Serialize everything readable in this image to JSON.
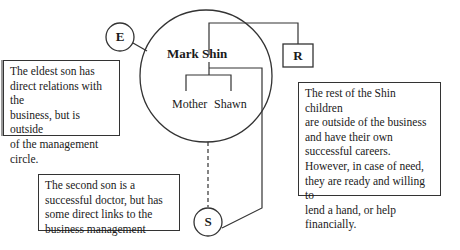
{
  "diagram": {
    "center_person": "Mark Shin",
    "inner_members": [
      "Mother",
      "Shawn"
    ],
    "nodes": {
      "E": "E",
      "R": "R",
      "S": "S"
    },
    "notes": {
      "eldest": "The eldest son has direct relations with the business, but is outside of the management circle.",
      "eldest_lines": [
        "The eldest son has",
        "direct relations with the",
        "business, but is outside",
        "of the management",
        "circle."
      ],
      "rest_lines": [
        "The rest of the Shin children",
        "are outside of the business",
        "and have their own",
        "successful careers.",
        "However, in case of need,",
        "they are ready and willing to",
        "lend a hand, or help",
        "financially."
      ],
      "second_lines": [
        "The second son is a",
        "successful doctor, but has",
        "some direct links to the",
        "business management"
      ]
    },
    "colors": {
      "line": "#333333",
      "text": "#1a1a1a",
      "background": "#ffffff"
    }
  }
}
